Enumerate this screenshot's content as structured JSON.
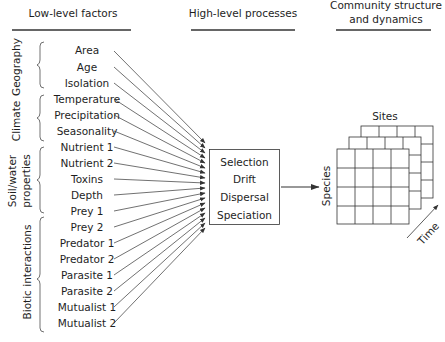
{
  "headers": {
    "low": "Low-level factors",
    "high": "High-level processes",
    "community_line1": "Community structure",
    "community_line2": "and dynamics"
  },
  "groups": [
    {
      "label_lines": [
        "Geography"
      ],
      "factors": [
        "Area",
        "Age",
        "Isolation"
      ]
    },
    {
      "label_lines": [
        "Climate"
      ],
      "factors": [
        "Temperature",
        "Precipitation",
        "Seasonality"
      ]
    },
    {
      "label_lines": [
        "Soil/water",
        "properties"
      ],
      "factors": [
        "Nutrient 1",
        "Nutrient 2",
        "Toxins",
        "Depth"
      ]
    },
    {
      "label_lines": [
        "Biotic interactions"
      ],
      "factors": [
        "Prey 1",
        "Prey 2",
        "Predator 1",
        "Predator 2",
        "Parasite 1",
        "Parasite 2",
        "Mutualist 1",
        "Mutualist 2"
      ]
    }
  ],
  "factors": [
    "Area",
    "Age",
    "Isolation",
    "Temperature",
    "Precipitation",
    "Seasonality",
    "Nutrient 1",
    "Nutrient 2",
    "Toxins",
    "Depth",
    "Prey 1",
    "Prey 2",
    "Predator 1",
    "Predator 2",
    "Parasite 1",
    "Parasite 2",
    "Mutualist 1",
    "Mutualist 2"
  ],
  "processes": [
    "Selection",
    "Drift",
    "Dispersal",
    "Speciation"
  ],
  "community": {
    "axis_sites": "Sites",
    "axis_species": "Species",
    "axis_time": "Time",
    "grid_rows": 4,
    "grid_cols": 4,
    "layers": 3
  },
  "colors": {
    "ink": "#1e1e1e",
    "line": "#333333",
    "background": "#ffffff"
  }
}
